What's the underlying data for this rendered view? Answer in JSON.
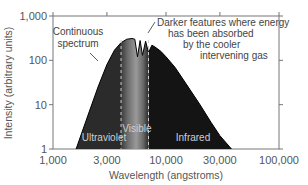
{
  "chart_data": {
    "type": "area",
    "title": "",
    "xlabel": "Wavelength (angstroms)",
    "ylabel": "Intensity (arbitrary units)",
    "xscale": "log",
    "yscale": "log",
    "xlim": [
      1000,
      100000
    ],
    "ylim": [
      1,
      1000
    ],
    "x_ticks": [
      "1,000",
      "3,000",
      "10,000",
      "30,000",
      "100,000"
    ],
    "y_ticks": [
      "1,000",
      "100",
      "10",
      "1"
    ],
    "grid": false,
    "legend": null,
    "series": [
      {
        "name": "Solar spectrum",
        "x": [
          1600,
          2000,
          2500,
          3000,
          3500,
          4000,
          4500,
          5000,
          5300,
          5600,
          5900,
          6200,
          6600,
          7000,
          7500,
          8000,
          9000,
          10000,
          12000,
          15000,
          20000,
          25000,
          30000,
          38000
        ],
        "y": [
          1,
          5,
          25,
          80,
          170,
          250,
          300,
          310,
          300,
          120,
          280,
          130,
          270,
          150,
          220,
          200,
          160,
          120,
          70,
          30,
          10,
          4,
          2,
          1
        ]
      }
    ],
    "bands": [
      {
        "label": "Ultraviolet",
        "from": 1000,
        "to": 4000,
        "color": "#2a2a2a"
      },
      {
        "label": "Visible",
        "from": 4000,
        "to": 7000,
        "color": "#8a8a8a"
      },
      {
        "label": "Infrared",
        "from": 7000,
        "to": 100000,
        "color": "#111111"
      }
    ],
    "annotations": [
      {
        "text": [
          "Continuous",
          "spectrum"
        ],
        "points_to": "smooth curve envelope"
      },
      {
        "text": [
          "Darker features where energy",
          "has been absorbed",
          "by the cooler",
          "intervening gas"
        ],
        "points_to": "absorption dips near 6,000 Å"
      }
    ]
  },
  "labels": {
    "x_ticks": [
      "1,000",
      "3,000",
      "10,000",
      "30,000",
      "100,000"
    ],
    "y_ticks": [
      "1,000",
      "100",
      "10",
      "1"
    ],
    "xlabel": "Wavelength (angstroms)",
    "ylabel": "Intensity (arbitrary units)",
    "annot_left": [
      "Continuous",
      "spectrum"
    ],
    "annot_right": [
      "Darker features where energy",
      "has been absorbed",
      "by the cooler",
      "intervening gas"
    ],
    "bands": [
      "Ultraviolet",
      "Visible",
      "Infrared"
    ]
  }
}
